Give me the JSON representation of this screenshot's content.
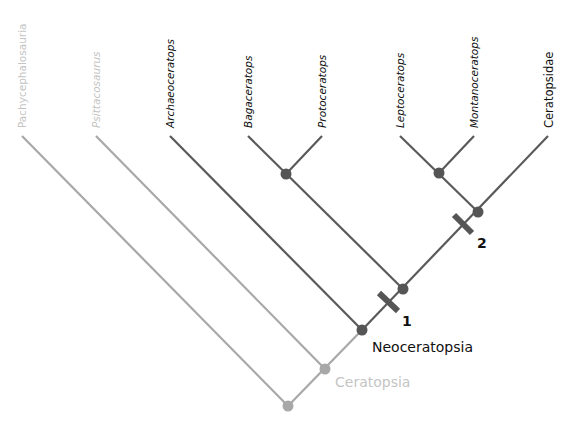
{
  "colors": {
    "dark": "#5a5a5a",
    "light": "#a8a8a8",
    "label_dark": "#111111",
    "label_light": "#c4c4c4"
  },
  "taxa": [
    {
      "name": "Pachycephalosauria",
      "italic": false,
      "tone": "light"
    },
    {
      "name": "Psittacosaurus",
      "italic": true,
      "tone": "light"
    },
    {
      "name": "Archaeoceratops",
      "italic": true,
      "tone": "dark"
    },
    {
      "name": "Bagaceratops",
      "italic": true,
      "tone": "dark"
    },
    {
      "name": "Protoceratops",
      "italic": true,
      "tone": "dark"
    },
    {
      "name": "Leptoceratops",
      "italic": true,
      "tone": "dark"
    },
    {
      "name": "Montanoceratops",
      "italic": true,
      "tone": "dark"
    },
    {
      "name": "Ceratopsidae",
      "italic": false,
      "tone": "dark"
    }
  ],
  "clades": {
    "ceratopsia": "Ceratopsia",
    "neoceratopsia": "Neoceratopsia"
  },
  "markers": {
    "m1": "1",
    "m2": "2"
  }
}
